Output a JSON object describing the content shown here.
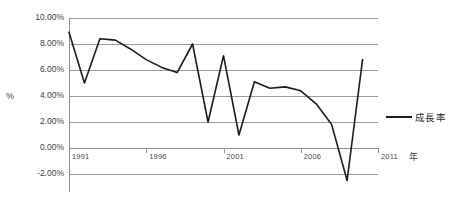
{
  "chart_data": {
    "type": "line",
    "title": "",
    "xlabel": "年",
    "ylabel": "%",
    "ylim": [
      -3.0,
      10.0
    ],
    "xlim": [
      1991,
      2011
    ],
    "grid": true,
    "legend_position": "right",
    "y_ticks": [
      "10.00%",
      "8.00%",
      "6.00%",
      "4.00%",
      "2.00%",
      "0.00%",
      "-2.00%"
    ],
    "y_tick_values": [
      10,
      8,
      6,
      4,
      2,
      0,
      -2
    ],
    "x_ticks": [
      "1991",
      "1996",
      "2001",
      "2006",
      "2011"
    ],
    "x_tick_values": [
      1991,
      1996,
      2001,
      2006,
      2011
    ],
    "x": [
      1991,
      1992,
      1993,
      1994,
      1995,
      1996,
      1997,
      1998,
      1999,
      2000,
      2001,
      2002,
      2003,
      2004,
      2005,
      2006,
      2007,
      2008,
      2009,
      2010
    ],
    "series": [
      {
        "name": "成長率",
        "color": "#1b1b1b",
        "values": [
          8.9,
          5.0,
          8.4,
          8.3,
          7.6,
          6.8,
          6.2,
          5.8,
          8.0,
          2.0,
          7.1,
          1.0,
          5.1,
          4.6,
          4.7,
          4.4,
          3.4,
          1.8,
          -2.5,
          6.8
        ]
      }
    ]
  },
  "legend": {
    "entries": [
      {
        "label": "成長率"
      }
    ]
  },
  "axes": {
    "y_title": "%",
    "x_unit": "年"
  }
}
